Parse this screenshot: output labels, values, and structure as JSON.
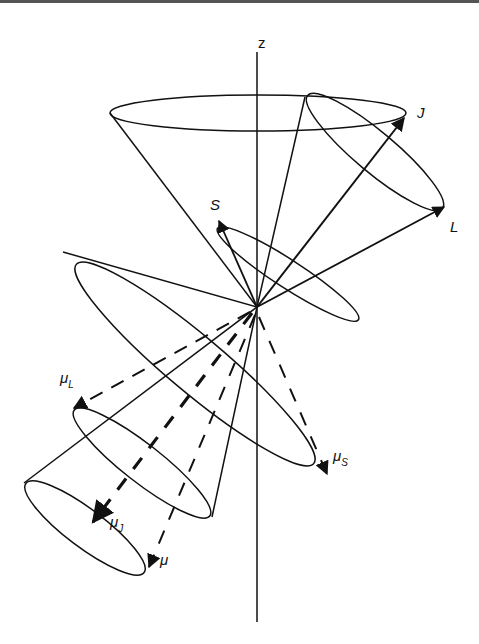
{
  "diagram": {
    "type": "vector-model-cones",
    "axis_label": "z",
    "vectors": [
      {
        "name": "J",
        "label": "J",
        "style": "solid"
      },
      {
        "name": "L",
        "label": "L",
        "style": "solid"
      },
      {
        "name": "S",
        "label": "S",
        "style": "solid"
      },
      {
        "name": "mu_L",
        "label": "μ",
        "subscript": "L",
        "style": "dashed"
      },
      {
        "name": "mu_S",
        "label": "μ",
        "subscript": "S",
        "style": "dashed"
      },
      {
        "name": "mu_J",
        "label": "μ",
        "subscript": "J",
        "style": "dashed-bold"
      },
      {
        "name": "mu",
        "label": "μ",
        "subscript": "",
        "style": "dashed"
      }
    ]
  },
  "labels": {
    "z": "z",
    "J": "J",
    "L": "L",
    "S": "S",
    "mu": "μ",
    "sub_L": "L",
    "sub_S": "S",
    "sub_J": "J"
  },
  "colors": {
    "stroke": "#111111",
    "background": "#ffffff"
  }
}
